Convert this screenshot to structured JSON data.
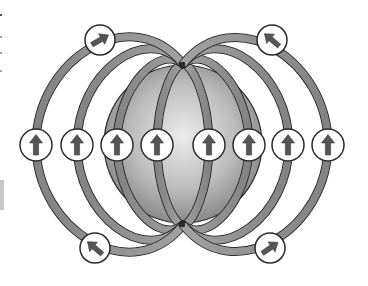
{
  "diagram": {
    "sphere": {
      "center": [
        183,
        144
      ],
      "radius": 79,
      "fill_light": "#e6e6e6",
      "fill_dark": "#8c8c8c"
    },
    "poles": {
      "top": [
        183,
        64
      ],
      "bottom": [
        183,
        225
      ]
    },
    "loops": [
      {
        "name": "inner-left",
        "half_width": -26
      },
      {
        "name": "inner-right",
        "half_width": 26
      },
      {
        "name": "mid-left",
        "half_width": -66
      },
      {
        "name": "mid-right",
        "half_width": 66
      },
      {
        "name": "outer-left",
        "half_width": -106
      },
      {
        "name": "outer-right",
        "half_width": 106
      },
      {
        "name": "outermost-left",
        "half_width": -147
      },
      {
        "name": "outermost-right",
        "half_width": 145
      }
    ],
    "indicators": [
      {
        "name": "indicator-top-left",
        "cx": 100,
        "cy": 40,
        "r": 15,
        "arrow_angle": -30,
        "direction": "up-right"
      },
      {
        "name": "indicator-top-right",
        "cx": 272,
        "cy": 40,
        "r": 15,
        "arrow_angle": -140,
        "direction": "up-left"
      },
      {
        "name": "indicator-bottom-left",
        "cx": 95,
        "cy": 248,
        "r": 15,
        "arrow_angle": -140,
        "direction": "up-left"
      },
      {
        "name": "indicator-bottom-right",
        "cx": 270,
        "cy": 248,
        "r": 15,
        "arrow_angle": -35,
        "direction": "up-right"
      },
      {
        "name": "indicator-mid-1",
        "cx": 36,
        "cy": 145,
        "r": 16,
        "arrow_angle": -90,
        "direction": "up"
      },
      {
        "name": "indicator-mid-2",
        "cx": 77,
        "cy": 145,
        "r": 16,
        "arrow_angle": -90,
        "direction": "up"
      },
      {
        "name": "indicator-mid-3",
        "cx": 117,
        "cy": 145,
        "r": 16,
        "arrow_angle": -90,
        "direction": "up"
      },
      {
        "name": "indicator-mid-4",
        "cx": 157,
        "cy": 145,
        "r": 16,
        "arrow_angle": -90,
        "direction": "up"
      },
      {
        "name": "indicator-mid-5",
        "cx": 209,
        "cy": 145,
        "r": 16,
        "arrow_angle": -90,
        "direction": "up"
      },
      {
        "name": "indicator-mid-6",
        "cx": 249,
        "cy": 145,
        "r": 16,
        "arrow_angle": -90,
        "direction": "up"
      },
      {
        "name": "indicator-mid-7",
        "cx": 288,
        "cy": 145,
        "r": 16,
        "arrow_angle": -90,
        "direction": "up"
      },
      {
        "name": "indicator-mid-8",
        "cx": 328,
        "cy": 145,
        "r": 16,
        "arrow_angle": -90,
        "direction": "up"
      }
    ],
    "colors": {
      "loop_fill": "#8a8a8a",
      "loop_highlight": "#bdbdbd",
      "outline": "#2b2b2b",
      "arrow": "#555555",
      "indicator_fill": "#ffffff",
      "background": "#ffffff"
    }
  }
}
